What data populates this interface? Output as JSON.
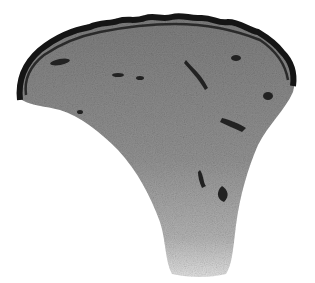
{
  "image": {
    "subject": "skin tissue section micrograph",
    "style": "grayscale",
    "background_color": "#ffffff",
    "epidermis_color": "#151515",
    "dermis_color": "#8a8a8a",
    "lower_dermis_color": "#b8b8b8",
    "caption": ""
  }
}
